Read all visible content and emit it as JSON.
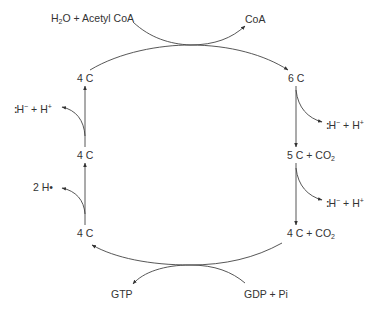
{
  "diagram": {
    "inputs_top": {
      "left": {
        "pre": "H",
        "sub": "2",
        "post": "O + Acetyl CoA"
      },
      "right": "CoA"
    },
    "nodes": {
      "left_top": "4 C",
      "left_mid": "4 C",
      "left_bottom": "4 C",
      "right_top": "6 C",
      "right_mid": {
        "pre": "5 C + CO",
        "sub": "2"
      },
      "right_bottom": {
        "pre": "4 C + CO",
        "sub": "2"
      }
    },
    "side_products": {
      "left_upper": {
        "dots": ":",
        "text": "H",
        "sup1": "−",
        "mid": " + H",
        "sup2": "+"
      },
      "left_lower": "2 H•",
      "right_upper": {
        "dots": ":",
        "text": "H",
        "sup1": "−",
        "mid": " + H",
        "sup2": "+"
      },
      "right_lower": {
        "dots": ":",
        "text": "H",
        "sup1": "−",
        "mid": " + H",
        "sup2": "+"
      }
    },
    "bottom": {
      "left": "GTP",
      "right": "GDP + Pi"
    },
    "colors": {
      "line": "#333333",
      "text": "#333333",
      "background": "#ffffff"
    }
  }
}
